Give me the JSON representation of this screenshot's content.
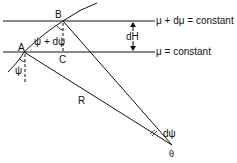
{
  "diagram": {
    "points": {
      "A": "A",
      "B": "B",
      "C": "C",
      "theta": "θ"
    },
    "labels": {
      "upper_surface": "μ + dμ = constant",
      "lower_surface": "μ = constant",
      "height_diff": "dH",
      "angle_plus": "ψ + dψ",
      "angle_psi": "ψ",
      "radius": "R",
      "dpsi": "dψ"
    },
    "colors": {
      "line": "#111111",
      "background": "#ffffff"
    }
  }
}
